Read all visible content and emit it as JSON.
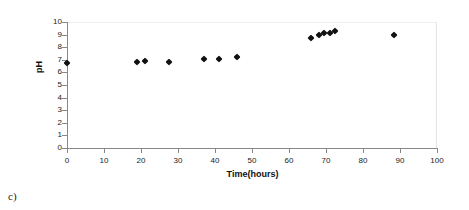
{
  "caption": "c)",
  "chart_data": {
    "type": "scatter",
    "title": "",
    "xlabel": "Time(hours)",
    "ylabel": "pH",
    "xlim": [
      0,
      100
    ],
    "ylim": [
      0,
      10
    ],
    "xticks": [
      0,
      10,
      20,
      30,
      40,
      50,
      60,
      70,
      80,
      90,
      100
    ],
    "yticks": [
      0,
      1,
      2,
      3,
      4,
      5,
      6,
      7,
      8,
      9,
      10
    ],
    "grid": false,
    "legend": "none",
    "marker": "diamond",
    "marker_color": "#111111",
    "series": [
      {
        "name": "pH",
        "points": [
          {
            "x": 0,
            "y": 6.75
          },
          {
            "x": 19,
            "y": 6.85
          },
          {
            "x": 21,
            "y": 6.9
          },
          {
            "x": 27.5,
            "y": 6.85
          },
          {
            "x": 37,
            "y": 7.1
          },
          {
            "x": 41,
            "y": 7.1
          },
          {
            "x": 46,
            "y": 7.2
          },
          {
            "x": 66,
            "y": 8.75
          },
          {
            "x": 68,
            "y": 9.0
          },
          {
            "x": 69.5,
            "y": 9.1
          },
          {
            "x": 71,
            "y": 9.15
          },
          {
            "x": 72.5,
            "y": 9.25
          },
          {
            "x": 88.5,
            "y": 9.0
          }
        ]
      }
    ]
  }
}
